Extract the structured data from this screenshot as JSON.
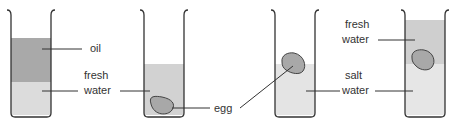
{
  "diagram": {
    "beakers": [
      {
        "id": 1,
        "layers": [
          "oil",
          "fresh water"
        ],
        "egg": "none"
      },
      {
        "id": 2,
        "layers": [
          "fresh water"
        ],
        "egg": "bottom"
      },
      {
        "id": 3,
        "layers": [
          "salt water"
        ],
        "egg": "floating at surface"
      },
      {
        "id": 4,
        "layers": [
          "fresh water",
          "salt water"
        ],
        "egg": "at interface"
      }
    ],
    "labels": {
      "oil": "oil",
      "fresh_water_1a": "fresh",
      "fresh_water_1b": "water",
      "egg": "egg",
      "salt_water_a": "salt",
      "salt_water_b": "water",
      "fresh_water_4a": "fresh",
      "fresh_water_4b": "water"
    },
    "colors": {
      "oil": "#a9a9a9",
      "fresh_water": "#cfcfcf",
      "salt_water": "#e6e6e6",
      "egg": "#a8a8a8",
      "outline": "#333333"
    }
  }
}
